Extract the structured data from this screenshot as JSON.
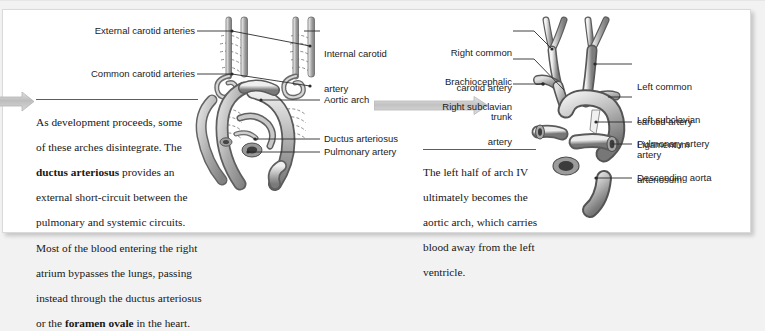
{
  "figure": {
    "type": "anatomical-diagram",
    "panels": [
      {
        "id": "middle-panel",
        "caption": "As development proceeds, some of these arches disintegrate. The ductus arteriosus provides an external short-circuit between the pulmonary and systemic circuits. Most of the blood entering the right atrium bypasses the lungs, passing instead through the ductus arteriosus or the foramen ovale in the heart.",
        "caption_lines": [
          {
            "text": "As development proceeds, some",
            "bold": []
          },
          {
            "text": "of these arches disintegrate. The",
            "bold": []
          },
          {
            "text": "ductus arteriosus provides an",
            "bold": [
              "ductus arteriosus"
            ]
          },
          {
            "text": "external short-circuit between the",
            "bold": []
          },
          {
            "text": "pulmonary and systemic circuits.",
            "bold": []
          },
          {
            "text": "Most of the blood entering the right",
            "bold": []
          },
          {
            "text": "atrium bypasses the lungs, passing",
            "bold": []
          },
          {
            "text": "instead through the ductus arteriosus",
            "bold": []
          },
          {
            "text": "or the foramen ovale in the heart.",
            "bold": [
              "foramen ovale"
            ]
          }
        ],
        "labels_left": [
          {
            "id": "external-carotid-arteries",
            "text": "External carotid arteries"
          },
          {
            "id": "common-carotid-arteries",
            "text": "Common carotid arteries"
          }
        ],
        "labels_right": [
          {
            "id": "internal-carotid-artery",
            "line1": "Internal carotid",
            "line2": "artery"
          },
          {
            "id": "aortic-arch",
            "line1": "Aortic arch",
            "line2": ""
          },
          {
            "id": "ductus-arteriosus",
            "line1": "Ductus arteriosus",
            "line2": ""
          },
          {
            "id": "pulmonary-artery",
            "line1": "Pulmonary artery",
            "line2": ""
          }
        ]
      },
      {
        "id": "right-panel",
        "caption": "The left half of arch IV ultimately becomes the aortic arch, which carries blood away from the left ventricle.",
        "caption_lines": [
          {
            "text": "The left half of arch IV",
            "bold": []
          },
          {
            "text": "ultimately becomes the",
            "bold": []
          },
          {
            "text": "aortic arch, which carries",
            "bold": []
          },
          {
            "text": "blood away from the left",
            "bold": []
          },
          {
            "text": "ventricle.",
            "bold": []
          }
        ],
        "labels_left": [
          {
            "id": "right-common-carotid-artery",
            "line1": "Right common",
            "line2": "carotid artery"
          },
          {
            "id": "brachiocephalic-trunk",
            "line1": "Brachiocephalic",
            "line2": "trunk"
          },
          {
            "id": "right-subclavian-artery",
            "line1": "Right subclavian",
            "line2": "artery"
          }
        ],
        "labels_right": [
          {
            "id": "left-common-carotid-artery",
            "line1": "Left common",
            "line2": "carotid artery"
          },
          {
            "id": "left-subclavian-artery",
            "line1": "Left subclavian",
            "line2": "artery"
          },
          {
            "id": "ligamentum-arteriosum",
            "line1": "Ligamentum",
            "line2": "arteriosum"
          },
          {
            "id": "pulmonary-artery-right",
            "line1": "Pulmonary artery",
            "line2": ""
          },
          {
            "id": "descending-aorta",
            "line1": "Descending aorta",
            "line2": ""
          }
        ]
      }
    ],
    "flow_arrows": [
      {
        "id": "incoming-flow-arrow",
        "direction": "right"
      },
      {
        "id": "panel-transition-arrow",
        "direction": "right"
      }
    ],
    "colors": {
      "page_background": "#f2f2f2",
      "card_background": "#ffffff",
      "card_border": "#dadada",
      "label_text": "#1b1b1b",
      "caption_text": "#171717",
      "leader_line": "#2b2b2b",
      "arrow_gray": "#c9c9c9",
      "vessel_light": "#e8e8e8",
      "vessel_mid": "#a9a9a9",
      "vessel_dark": "#6e6e6e",
      "vessel_outline": "#4a4a4a"
    }
  }
}
